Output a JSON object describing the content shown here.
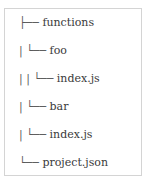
{
  "tree": {
    "lines": [
      {
        "prefix": "├── ",
        "name": "functions"
      },
      {
        "prefix": "| └── ",
        "name": "foo"
      },
      {
        "prefix": "| | └── ",
        "name": "index.js"
      },
      {
        "prefix": "| └── ",
        "name": "bar"
      },
      {
        "prefix": "| └── ",
        "name": "index.js"
      },
      {
        "prefix": "└── ",
        "name": "project.json"
      }
    ]
  }
}
